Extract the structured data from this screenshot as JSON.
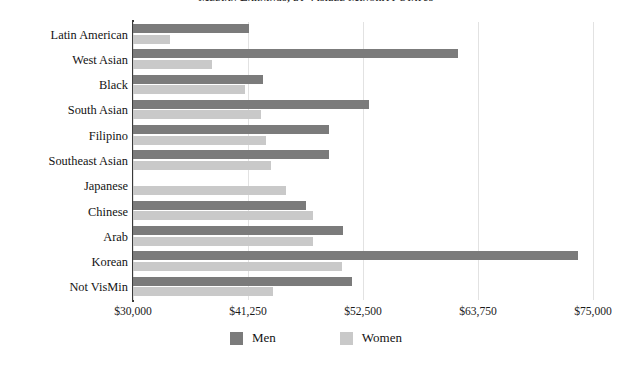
{
  "chart_data": {
    "type": "bar",
    "orientation": "horizontal",
    "title": "Median Earnings, by Visible Minority Status",
    "xlabel": "",
    "ylabel": "",
    "xlim": [
      30000,
      75000
    ],
    "grid": true,
    "legend_position": "bottom-center",
    "categories": [
      "Latin American",
      "West Asian",
      "Black",
      "South Asian",
      "Filipino",
      "Southeast Asian",
      "Japanese",
      "Chinese",
      "Arab",
      "Korean",
      "Not VisMin"
    ],
    "x_tick_values": [
      30000,
      41250,
      52500,
      63750,
      75000
    ],
    "x_tick_labels": [
      "$30,000",
      "$41,250",
      "$52,500",
      "$63,750",
      "$75,000"
    ],
    "series": [
      {
        "name": "Men",
        "color": "#7b7b7b",
        "values": [
          41350,
          61800,
          42700,
          53100,
          49200,
          49200,
          30000,
          46900,
          50500,
          73500,
          51400
        ]
      },
      {
        "name": "Women",
        "color": "#c9c9c9",
        "values": [
          33600,
          37700,
          41000,
          42500,
          43000,
          43500,
          45000,
          47600,
          47600,
          50400,
          43700
        ]
      }
    ]
  },
  "colors": {
    "men": "#7b7b7b",
    "women": "#c9c9c9",
    "gridline": "#e2e2e2",
    "axis": "#3a3a3a",
    "background": "#ffffff",
    "text": "#131313"
  }
}
